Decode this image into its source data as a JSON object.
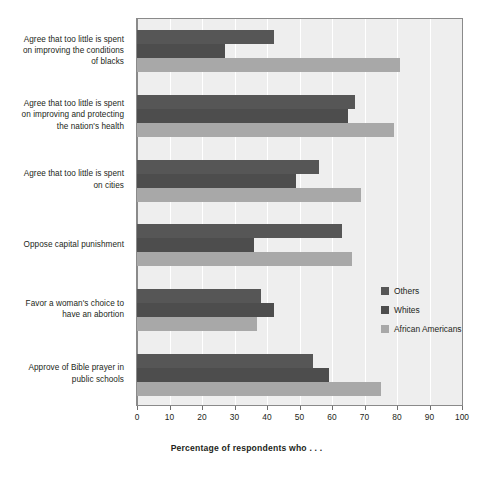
{
  "chart_data": {
    "type": "bar",
    "orientation": "horizontal",
    "title": "",
    "xlabel": "Percentage of respondents who . . .",
    "ylabel": "",
    "xlim": [
      0,
      100
    ],
    "xticks": [
      0,
      10,
      20,
      30,
      40,
      50,
      60,
      70,
      80,
      90,
      100
    ],
    "grid": true,
    "legend_position": "right-middle",
    "categories": [
      "Agree that too little is spent on improving the conditions of blacks",
      "Agree that too little is spent on improving and protecting the nation's health",
      "Agree that too little is spent on cities",
      "Oppose capital punishment",
      "Favor a woman's choice to have an abortion",
      "Approve of Bible prayer in public schools"
    ],
    "category_lines": [
      [
        "Agree that too little is spent",
        "on improving the conditions",
        "of blacks"
      ],
      [
        "Agree that too little is spent",
        "on improving and protecting",
        "the nation's health"
      ],
      [
        "Agree that too little is spent",
        "on cities"
      ],
      [
        "Oppose capital punishment"
      ],
      [
        "Favor a woman's choice to",
        "have an abortion"
      ],
      [
        "Approve of Bible prayer in",
        "public schools"
      ]
    ],
    "series": [
      {
        "name": "Others",
        "color": "#565656",
        "values": [
          42,
          67,
          56,
          63,
          38,
          54
        ]
      },
      {
        "name": "Whites",
        "color": "#4d4d4d",
        "values": [
          27,
          65,
          49,
          36,
          42,
          59
        ]
      },
      {
        "name": "African Americans",
        "color": "#a8a8a8",
        "values": [
          81,
          79,
          69,
          66,
          37,
          75
        ]
      }
    ]
  },
  "plot": {
    "background_color": "#eeeeee",
    "border_color": "#8a8a8a",
    "gridline_color": "#ffffff"
  },
  "legend": {
    "items": [
      {
        "label": "Others"
      },
      {
        "label": "Whites"
      },
      {
        "label": "African Americans"
      }
    ]
  }
}
